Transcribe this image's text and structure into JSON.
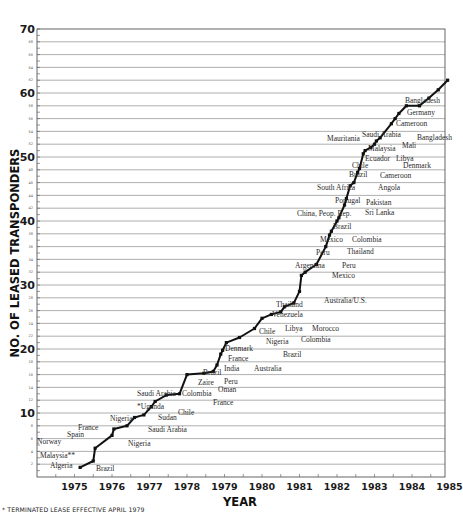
{
  "chart_data": {
    "type": "line",
    "title": "",
    "xlabel": "YEAR",
    "ylabel": "NO. OF LEASED TRANSPONDERS",
    "xlim": [
      1974.0,
      1985.0
    ],
    "ylim": [
      0,
      70
    ],
    "x_ticks": [
      "1975",
      "1976",
      "1977",
      "1978",
      "1979",
      "1980",
      "1981",
      "1982",
      "1983",
      "1984",
      "1985"
    ],
    "y_ticks_major": [
      "10",
      "20",
      "30",
      "40",
      "50",
      "60",
      "70"
    ],
    "y_ticks_minor_step": 2,
    "grid": "horizontal every 2 units",
    "legend": null,
    "footnote": "* TERMINATED LEASE EFFECTIVE APRIL 1979",
    "points": [
      {
        "x": 1975.15,
        "y": 1.5,
        "label": "Algeria",
        "side": "left"
      },
      {
        "x": 1975.5,
        "y": 2.5,
        "label": "Brazil",
        "side": "right"
      },
      {
        "x": 1975.55,
        "y": 4.5,
        "label": "Malaysia**",
        "side": "left"
      },
      {
        "x": 1976.0,
        "y": 6.5,
        "label": "Norway",
        "side": "left"
      },
      {
        "x": 1976.05,
        "y": 7.5,
        "label": "Spain",
        "side": "left"
      },
      {
        "x": 1976.4,
        "y": 8.0,
        "label": "Nigeria",
        "side": "right"
      },
      {
        "x": 1976.6,
        "y": 9.3,
        "label": "France",
        "side": "left"
      },
      {
        "x": 1976.85,
        "y": 9.7,
        "label": "Saudi Arabia",
        "side": "right"
      },
      {
        "x": 1977.05,
        "y": 11.0,
        "label": "Nigeria",
        "side": "left"
      },
      {
        "x": 1977.15,
        "y": 11.8,
        "label": "Sudan",
        "side": "right"
      },
      {
        "x": 1977.45,
        "y": 12.8,
        "label": "*Uganda",
        "side": "left"
      },
      {
        "x": 1977.8,
        "y": 13.0,
        "label": "Chile",
        "side": "right"
      },
      {
        "x": 1978.0,
        "y": 16.0,
        "label": "Saudi Arabia",
        "side": "left"
      },
      {
        "x": 1978.45,
        "y": 16.2,
        "label": "Colombia",
        "side": "left"
      },
      {
        "x": 1978.7,
        "y": 16.5,
        "label": "France",
        "side": "right"
      },
      {
        "x": 1978.8,
        "y": 17.5,
        "label": "Oman",
        "side": "right"
      },
      {
        "x": 1978.9,
        "y": 19.2,
        "label": "Zaire",
        "side": "left"
      },
      {
        "x": 1978.95,
        "y": 19.8,
        "label": "Peru",
        "side": "right"
      },
      {
        "x": 1979.05,
        "y": 21.0,
        "label": "Brazil",
        "side": "left"
      },
      {
        "x": 1979.4,
        "y": 21.8,
        "label": "India",
        "side": "left"
      },
      {
        "x": 1979.8,
        "y": 23.2,
        "label": "Australia",
        "side": "right"
      },
      {
        "x": 1980.0,
        "y": 24.8,
        "label": "France",
        "side": "left"
      },
      {
        "x": 1980.25,
        "y": 25.4,
        "label": "Denmark",
        "side": "left"
      },
      {
        "x": 1980.5,
        "y": 25.8,
        "label": "Brazil",
        "side": "right"
      },
      {
        "x": 1980.6,
        "y": 26.6,
        "label": "Nigeria",
        "side": "left"
      },
      {
        "x": 1980.85,
        "y": 27.2,
        "label": "Colombia",
        "side": "right"
      },
      {
        "x": 1980.88,
        "y": 27.8,
        "label": "Chile",
        "side": "left"
      },
      {
        "x": 1981.0,
        "y": 29.0,
        "label": "Libya",
        "side": "left"
      },
      {
        "x": 1981.05,
        "y": 29.2,
        "label": "Morocco",
        "side": "right"
      },
      {
        "x": 1981.05,
        "y": 31.5,
        "label": "Venezuela",
        "side": "left"
      },
      {
        "x": 1981.15,
        "y": 32.0,
        "label": "Thailand",
        "side": "left"
      },
      {
        "x": 1981.45,
        "y": 33.2,
        "label": "Australia/U.S.",
        "side": "right"
      },
      {
        "x": 1481.0,
        "y": 0,
        "label": "",
        "side": "none"
      }
    ],
    "series": [
      {
        "name": "Leased transponders (cumulative)",
        "x": [
          1975.15,
          1975.5,
          1975.55,
          1976.0,
          1976.05,
          1976.4,
          1976.6,
          1976.85,
          1977.05,
          1977.15,
          1977.45,
          1977.8,
          1978.0,
          1978.45,
          1978.7,
          1978.8,
          1978.9,
          1978.95,
          1979.05,
          1979.4,
          1979.8,
          1980.0,
          1980.25,
          1980.5,
          1980.6,
          1980.85,
          1981.0,
          1981.05,
          1981.15,
          1981.45,
          1981.7,
          1981.8,
          1981.85,
          1982.0,
          1982.05,
          1982.2,
          1982.25,
          1982.35,
          1982.45,
          1982.55,
          1982.6,
          1982.7,
          1982.75,
          1982.9,
          1983.0,
          1983.05,
          1983.15,
          1983.45,
          1983.55,
          1983.65,
          1983.85,
          1984.2,
          1984.45,
          1984.7,
          1984.95
        ],
        "y": [
          1.5,
          2.5,
          4.5,
          6.5,
          7.5,
          8.0,
          9.3,
          9.7,
          11.0,
          11.8,
          12.8,
          13.0,
          16.0,
          16.2,
          16.5,
          17.5,
          19.2,
          19.8,
          21.0,
          21.8,
          23.2,
          24.8,
          25.4,
          25.8,
          26.6,
          27.2,
          29.0,
          31.5,
          32.0,
          33.2,
          36.0,
          37.8,
          38.4,
          40.0,
          40.5,
          42.5,
          43.5,
          45.5,
          46.0,
          47.6,
          48.2,
          50.5,
          51.0,
          51.5,
          52.0,
          52.5,
          53.0,
          55.2,
          56.0,
          56.8,
          58.0,
          58.0,
          59.2,
          60.5,
          62.0
        ]
      }
    ]
  },
  "labels": {
    "ylabel": "NO. OF LEASED TRANSPONDERS",
    "xlabel": "YEAR",
    "footnote": "* TERMINATED LEASE EFFECTIVE APRIL 1979"
  }
}
